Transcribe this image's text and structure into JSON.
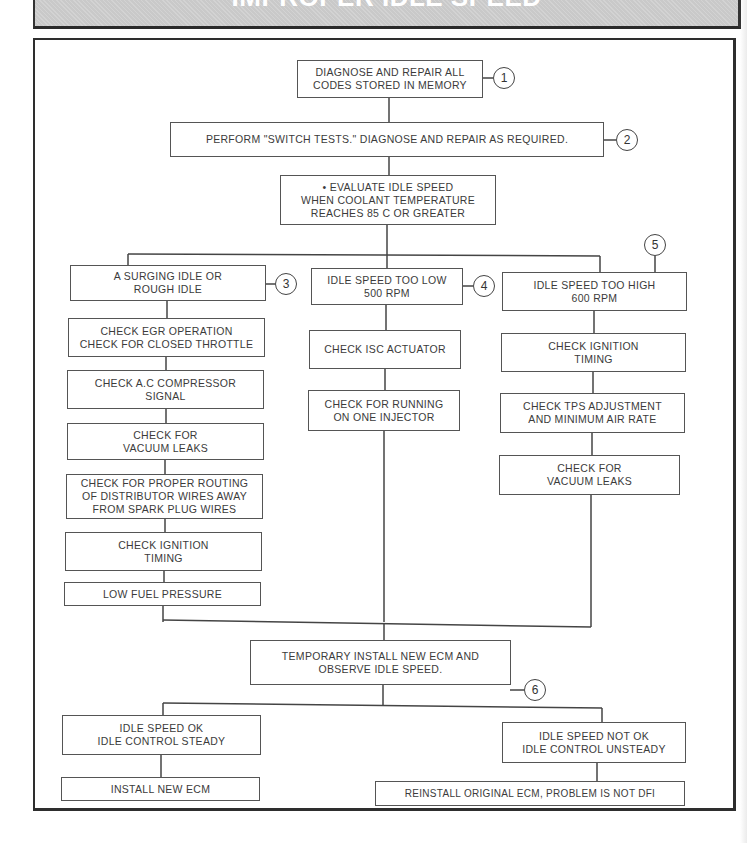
{
  "banner": {
    "title": "IMPROPER IDLE SPEED",
    "fill_color": "#c9c9c9"
  },
  "flowchart": {
    "step1": {
      "text": "DIAGNOSE AND REPAIR ALL\nCODES STORED IN MEMORY",
      "callout": "1"
    },
    "step2": {
      "text": "PERFORM \"SWITCH TESTS.\" DIAGNOSE AND REPAIR AS REQUIRED.",
      "callout": "2"
    },
    "step3": {
      "text": "• EVALUATE IDLE SPEED\nWHEN COOLANT TEMPERATURE\nREACHES 85 C OR GREATER"
    },
    "branches": {
      "left": {
        "header": "A SURGING IDLE OR\nROUGH IDLE",
        "callout": "3",
        "steps": [
          "CHECK EGR OPERATION\nCHECK FOR CLOSED THROTTLE",
          "CHECK A.C COMPRESSOR\nSIGNAL",
          "CHECK FOR\nVACUUM LEAKS",
          "CHECK FOR PROPER ROUTING\nOF DISTRIBUTOR WIRES AWAY\nFROM SPARK PLUG WIRES",
          "CHECK IGNITION\nTIMING",
          "LOW FUEL PRESSURE"
        ]
      },
      "middle": {
        "header": "IDLE SPEED TOO LOW\n500 RPM",
        "callout": "4",
        "steps": [
          "CHECK ISC ACTUATOR",
          "CHECK FOR RUNNING\nON ONE INJECTOR"
        ]
      },
      "right": {
        "header": "IDLE SPEED TOO HIGH\n600 RPM",
        "callout": "5",
        "steps": [
          "CHECK IGNITION\nTIMING",
          "CHECK TPS ADJUSTMENT\nAND MINIMUM AIR RATE",
          "CHECK FOR\nVACUUM LEAKS"
        ]
      }
    },
    "step_ecm": {
      "text": "TEMPORARY INSTALL NEW ECM AND\nOBSERVE IDLE SPEED.",
      "callout": "6"
    },
    "outcomes": {
      "ok": {
        "condition": "IDLE SPEED OK\nIDLE CONTROL STEADY",
        "action": "INSTALL NEW ECM"
      },
      "not_ok": {
        "condition": "IDLE SPEED NOT OK\nIDLE CONTROL UNSTEADY",
        "action": "REINSTALL ORIGINAL ECM, PROBLEM IS NOT DFI"
      }
    }
  }
}
